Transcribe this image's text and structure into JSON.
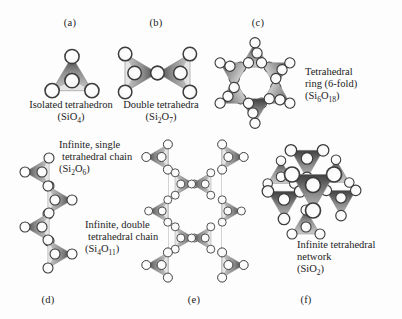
{
  "figure": {
    "background": "#fdfdfd",
    "ink": "#1b1b1b",
    "tetrahedron_dark": "#3f3f3f",
    "tetrahedron_mid": "#8c8c8c",
    "tetrahedron_light": "#cccccc",
    "oxygen_fill": "#f7f7f7",
    "oxygen_stroke": "#3c3c3c",
    "connector_line": "#c9c9c9"
  },
  "panels": {
    "a": {
      "label": "(a)",
      "line1": "Isolated tetrahedron",
      "formula": [
        {
          "t": "(SiO"
        },
        {
          "s": "4"
        },
        {
          "t": ")"
        }
      ]
    },
    "b": {
      "label": "(b)",
      "line1": "Double tetrahedra",
      "formula": [
        {
          "t": "(Si"
        },
        {
          "s": "2"
        },
        {
          "t": "O"
        },
        {
          "s": "7"
        },
        {
          "t": ")"
        }
      ]
    },
    "c": {
      "label": "(c)",
      "line1": "Tetrahedral",
      "line2": "ring (6-fold)",
      "formula": [
        {
          "t": "(Si"
        },
        {
          "s": "6"
        },
        {
          "t": "O"
        },
        {
          "s": "18"
        },
        {
          "t": ")"
        }
      ]
    },
    "d": {
      "label": "(d)",
      "line1": "Infinite, single",
      "line2": "tetrahedral chain",
      "formula": [
        {
          "t": "(Si"
        },
        {
          "s": "2"
        },
        {
          "t": "O"
        },
        {
          "s": "6"
        },
        {
          "t": ")"
        }
      ]
    },
    "e": {
      "label": "(e)",
      "line1": "Infinite, double",
      "line2": "tetrahedral chain",
      "formula": [
        {
          "t": "(Si"
        },
        {
          "s": "4"
        },
        {
          "t": "O"
        },
        {
          "s": "11"
        },
        {
          "t": ")"
        }
      ]
    },
    "f": {
      "label": "(f)",
      "line1": "Infinite tetrahedral",
      "line2": "network",
      "formula": [
        {
          "t": "(SiO"
        },
        {
          "s": "2"
        },
        {
          "t": ")"
        }
      ]
    }
  }
}
